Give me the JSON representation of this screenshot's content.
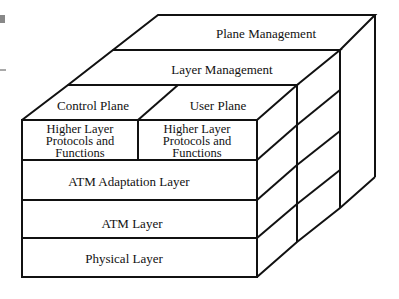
{
  "diagram": {
    "top_faces": {
      "plane_management": "Plane Management",
      "layer_management": "Layer Management",
      "control_plane": "Control Plane",
      "user_plane": "User Plane"
    },
    "front_rows": {
      "higher_layer_control": [
        "Higher Layer",
        "Protocols and",
        "Functions"
      ],
      "higher_layer_user": [
        "Higher Layer",
        "Protocols and",
        "Functions"
      ],
      "atm_adaptation": "ATM Adaptation Layer",
      "atm_layer": "ATM Layer",
      "physical_layer": "Physical Layer"
    },
    "colors": {
      "line": "#111111",
      "background": "#ffffff",
      "marker": "#888888"
    }
  }
}
